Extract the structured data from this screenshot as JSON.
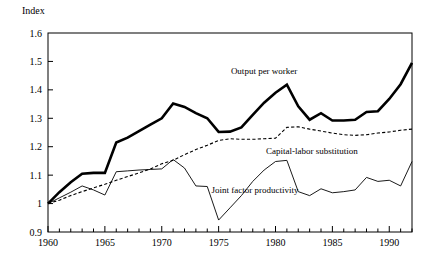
{
  "chart_data": {
    "type": "line",
    "title": "",
    "ylabel": "Index",
    "xlabel": "",
    "ylim": [
      0.9,
      1.6
    ],
    "xlim": [
      1960,
      1992
    ],
    "grid": false,
    "legend_position": "inline-annotations",
    "ytick_labels": [
      "0.9",
      "1",
      "1.1",
      "1.2",
      "1.3",
      "1.4",
      "1.5",
      "1.6"
    ],
    "ytick_values": [
      0.9,
      1.0,
      1.1,
      1.2,
      1.3,
      1.4,
      1.5,
      1.6
    ],
    "xtick_labels": [
      "1960",
      "1965",
      "1970",
      "1975",
      "1980",
      "1985",
      "1990"
    ],
    "xtick_values": [
      1960,
      1965,
      1970,
      1975,
      1980,
      1985,
      1990
    ],
    "xtick_minor_step": 1,
    "x": [
      1960,
      1961,
      1962,
      1963,
      1964,
      1965,
      1966,
      1967,
      1968,
      1969,
      1970,
      1971,
      1972,
      1973,
      1974,
      1975,
      1976,
      1977,
      1978,
      1979,
      1980,
      1981,
      1982,
      1983,
      1984,
      1985,
      1986,
      1987,
      1988,
      1989,
      1990,
      1991,
      1992
    ],
    "series": [
      {
        "name": "Output per worker",
        "style": "thick-solid",
        "label_x": 1979.0,
        "label_y": 1.455,
        "values": [
          1.0,
          1.04,
          1.075,
          1.105,
          1.108,
          1.108,
          1.215,
          1.232,
          1.255,
          1.278,
          1.3,
          1.352,
          1.34,
          1.318,
          1.3,
          1.252,
          1.253,
          1.268,
          1.312,
          1.355,
          1.39,
          1.418,
          1.342,
          1.295,
          1.318,
          1.292,
          1.292,
          1.295,
          1.322,
          1.325,
          1.368,
          1.42,
          1.495
        ]
      },
      {
        "name": "Capital-labor substitution",
        "style": "dashed",
        "label_x": 1983.2,
        "label_y": 1.175,
        "values": [
          1.0,
          1.012,
          1.028,
          1.042,
          1.055,
          1.068,
          1.082,
          1.095,
          1.108,
          1.122,
          1.14,
          1.152,
          1.172,
          1.19,
          1.205,
          1.222,
          1.228,
          1.226,
          1.226,
          1.228,
          1.23,
          1.268,
          1.27,
          1.262,
          1.255,
          1.248,
          1.242,
          1.24,
          1.242,
          1.248,
          1.252,
          1.258,
          1.262
        ]
      },
      {
        "name": "Joint factor productivity",
        "style": "thin-solid",
        "label_x": 1978.2,
        "label_y": 1.038,
        "values": [
          1.0,
          1.02,
          1.04,
          1.062,
          1.048,
          1.03,
          1.112,
          1.115,
          1.118,
          1.12,
          1.122,
          1.155,
          1.125,
          1.062,
          1.06,
          0.942,
          0.985,
          1.028,
          1.078,
          1.118,
          1.148,
          1.152,
          1.042,
          1.028,
          1.052,
          1.038,
          1.042,
          1.048,
          1.092,
          1.078,
          1.082,
          1.062,
          1.148
        ]
      }
    ]
  },
  "layout": {
    "plot_left": 48,
    "plot_right": 412,
    "plot_top": 33,
    "plot_bottom": 232
  }
}
